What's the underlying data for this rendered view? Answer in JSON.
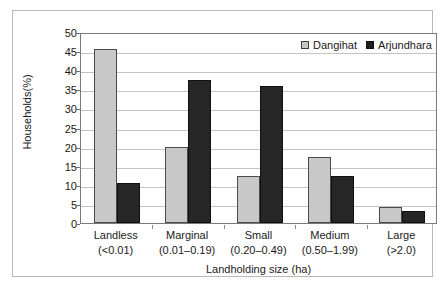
{
  "chart_data": {
    "type": "bar",
    "title": "",
    "xlabel": "Landholding size (ha)",
    "ylabel": "Households(%)",
    "ylim": [
      0,
      50
    ],
    "ytick_step": 5,
    "yticks": [
      50,
      45,
      40,
      35,
      30,
      25,
      20,
      15,
      10,
      5,
      0
    ],
    "grid": true,
    "legend_position": "top-right",
    "categories": [
      "Landless",
      "Marginal",
      "Small",
      "Medium",
      "Large"
    ],
    "category_sublabels": [
      "(<0.01)",
      "(0.01–0.19)",
      "(0.20–0.49)",
      "(0.50–1.99)",
      "(>2.0)"
    ],
    "series": [
      {
        "name": "Dangihat",
        "color": "#c8c8c8",
        "values": [
          45.5,
          20.0,
          12.4,
          17.2,
          4.1
        ]
      },
      {
        "name": "Arjundhara",
        "color": "#262626",
        "values": [
          10.5,
          37.5,
          35.8,
          12.3,
          3.1
        ]
      }
    ]
  },
  "colors": {
    "series_light": "#c8c8c8",
    "series_dark": "#262626",
    "gridline": "#c4c4c4",
    "axis": "#7a7a7a",
    "frame": "#b9b9b9",
    "text": "#1a1a1a"
  }
}
